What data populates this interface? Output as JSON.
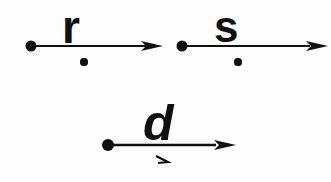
{
  "figure": {
    "background_color": "#fdfdfd",
    "ink_color": "#101010",
    "width": 331,
    "height": 182
  },
  "vectors": [
    {
      "label": "r",
      "name": "vector-r",
      "start_dot": {
        "x": 31,
        "y": 46,
        "radius": 5.5
      },
      "line": {
        "x1": 31,
        "y1": 46,
        "x2": 152,
        "y2": 46
      },
      "arrowhead": {
        "tip_x": 163,
        "tip_y": 46,
        "length": 22,
        "half_width": 5
      },
      "label_pos": {
        "x": 62,
        "y": 4
      },
      "mark": {
        "type": "dot",
        "x": 84,
        "y": 62,
        "radius": 3.6
      }
    },
    {
      "label": "s",
      "name": "vector-s",
      "start_dot": {
        "x": 182,
        "y": 46,
        "radius": 5.5
      },
      "line": {
        "x1": 182,
        "y1": 46,
        "x2": 310,
        "y2": 46
      },
      "arrowhead": {
        "tip_x": 328,
        "tip_y": 46,
        "length": 22,
        "half_width": 5
      },
      "label_pos": {
        "x": 214,
        "y": 5
      },
      "mark": {
        "type": "dot",
        "x": 238,
        "y": 62,
        "radius": 3.6
      }
    },
    {
      "label": "d",
      "name": "vector-d",
      "start_dot": {
        "x": 108,
        "y": 145,
        "radius": 6
      },
      "line": {
        "x1": 108,
        "y1": 145,
        "x2": 216,
        "y2": 145
      },
      "arrowhead": {
        "tip_x": 236,
        "tip_y": 145,
        "length": 22,
        "half_width": 5
      },
      "label_pos": {
        "x": 143,
        "y": 98
      },
      "mark": {
        "type": "tick",
        "x": 156,
        "y": 156,
        "width": 12,
        "height": 10
      }
    }
  ]
}
